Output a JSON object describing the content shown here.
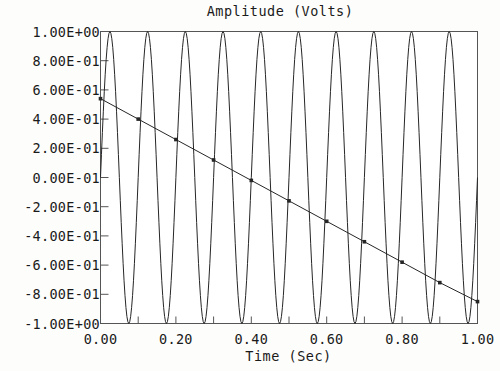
{
  "chart_data": {
    "type": "line",
    "title": "Amplitude (Volts)",
    "xlabel": "Time (Sec)",
    "ylabel": "Amplitude (Volts)",
    "xlim": [
      0.0,
      1.0
    ],
    "ylim": [
      -1.0,
      1.0
    ],
    "grid": false,
    "legend": "none",
    "x_tick_labels": [
      "0.00",
      "0.20",
      "0.40",
      "0.60",
      "0.80",
      "1.00"
    ],
    "x_tick_values": [
      0.0,
      0.2,
      0.4,
      0.6,
      0.8,
      1.0
    ],
    "x_minor_tick_values": [
      0.1,
      0.3,
      0.5,
      0.7,
      0.9
    ],
    "y_tick_labels": [
      "1.00E+00",
      "8.00E-01",
      "6.00E-01",
      "4.00E-01",
      "2.00E-01",
      "0.00E-01",
      "-2.00E-01",
      "-4.00E-01",
      "-6.00E-01",
      "-8.00E-01",
      "-1.00E+00"
    ],
    "y_tick_values": [
      1.0,
      0.8,
      0.6,
      0.4,
      0.2,
      0.0,
      -0.2,
      -0.4,
      -0.6,
      -0.8,
      -1.0
    ],
    "series": [
      {
        "name": "sine-wave",
        "kind": "sine",
        "amplitude": 1.0,
        "frequency_hz": 10,
        "phase_deg": 0,
        "samples": 400,
        "color": "#262626",
        "markers": false
      },
      {
        "name": "declining-line",
        "kind": "line",
        "color": "#262626",
        "markers": true,
        "marker_shape": "square",
        "x": [
          0.0,
          0.1,
          0.2,
          0.3,
          0.4,
          0.5,
          0.6,
          0.7,
          0.8,
          0.9,
          1.0
        ],
        "values": [
          0.54,
          0.4,
          0.26,
          0.12,
          -0.02,
          -0.16,
          -0.3,
          -0.44,
          -0.58,
          -0.72,
          -0.85
        ]
      }
    ],
    "axis_color": "#555555",
    "plot_background": "#ffffff",
    "page_background": "#fdfdfb"
  }
}
